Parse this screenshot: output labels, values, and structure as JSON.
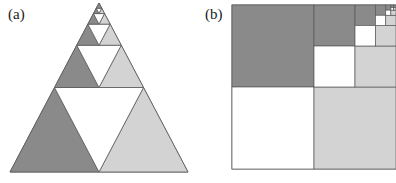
{
  "figure": {
    "width": 396,
    "height": 183,
    "background": "#ffffff"
  },
  "panels": [
    {
      "key": "a",
      "label": "(a)",
      "shape": "triangle",
      "description": "Sierpinski triangle subdivision",
      "label_pos": {
        "x": 8,
        "y": 7
      }
    },
    {
      "key": "b",
      "label": "(b)",
      "shape": "square",
      "description": "Recursive square quadrant subdivision",
      "label_pos": {
        "x": 205,
        "y": 7
      }
    }
  ],
  "colors": {
    "dark_gray": "#8a8a8a",
    "light_gray": "#d3d3d3",
    "white": "#ffffff",
    "outline": "#5a5a5a",
    "label_text": "#1a1a1a",
    "background": "#ffffff"
  },
  "chart_data": {
    "type": "diagram",
    "title": "",
    "panels": [
      {
        "key": "a",
        "label": "(a)",
        "type": "sierpinski-triangle",
        "depth": 5,
        "apex": {
          "x": 99,
          "y": 3
        },
        "base_left": {
          "x": 10,
          "y": 172
        },
        "base_right": {
          "x": 188,
          "y": 172
        },
        "rule": "Each upward triangle splits into 3 half-scale upward triangles (bottom-left, bottom-right, top) plus a white inverted middle triangle. Bottom-left is filled dark gray, bottom-right is filled light gray, top recurses.",
        "fill_bottom_left": "#8a8a8a",
        "fill_bottom_right": "#d3d3d3",
        "fill_middle": "#ffffff",
        "stroke": "#5a5a5a"
      },
      {
        "key": "b",
        "label": "(b)",
        "type": "recursive-square",
        "depth": 6,
        "origin": {
          "x": 34,
          "y": 5
        },
        "size": 164,
        "clipped_right_edge": true,
        "rule": "Each square splits into 4 quadrants: top-left filled dark gray, bottom-right filled light gray, bottom-left filled white, top-right recurses.",
        "fill_top_left": "#8a8a8a",
        "fill_bottom_right": "#d3d3d3",
        "fill_bottom_left": "#ffffff",
        "stroke": "#5a5a5a"
      }
    ]
  }
}
